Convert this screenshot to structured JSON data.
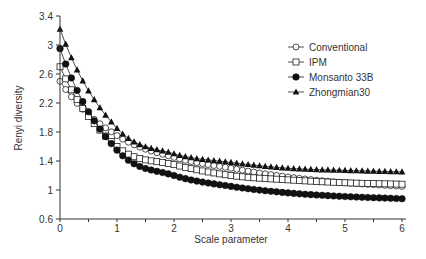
{
  "chart_data": {
    "type": "line",
    "title": "",
    "xlabel": "Scale parameter",
    "ylabel": "Renyi diversity",
    "xlim": [
      0,
      6
    ],
    "ylim": [
      0.6,
      3.4
    ],
    "xticks": [
      0,
      1,
      2,
      3,
      4,
      5,
      6
    ],
    "yticks": [
      0.6,
      1,
      1.4,
      1.8,
      2.2,
      2.6,
      3,
      3.4
    ],
    "ytick_labels": [
      "0.6",
      "1",
      "1.4",
      "1.8",
      "2.2",
      "2.6",
      "3",
      "3.4"
    ],
    "grid": false,
    "legend_position": "upper right",
    "x": [
      0,
      1,
      2,
      3,
      4,
      5,
      6
    ],
    "series": [
      {
        "name": "Conventional",
        "marker": "open-circle",
        "values": [
          2.5,
          1.75,
          1.45,
          1.3,
          1.18,
          1.1,
          1.05
        ]
      },
      {
        "name": "IPM",
        "marker": "open-square",
        "values": [
          2.7,
          1.6,
          1.35,
          1.2,
          1.14,
          1.1,
          1.08
        ]
      },
      {
        "name": "Monsanto 33B",
        "marker": "filled-circle",
        "values": [
          2.95,
          1.55,
          1.2,
          1.05,
          0.96,
          0.91,
          0.88
        ]
      },
      {
        "name": "Zhongmian30",
        "marker": "filled-triangle",
        "values": [
          3.22,
          1.85,
          1.5,
          1.38,
          1.3,
          1.27,
          1.25
        ]
      }
    ]
  }
}
